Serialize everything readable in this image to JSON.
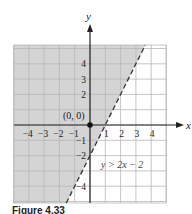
{
  "chart_data": {
    "type": "line",
    "title": "",
    "xlabel": "x",
    "ylabel": "y",
    "xlim": [
      -5,
      5
    ],
    "ylim": [
      -5,
      5
    ],
    "grid": true,
    "x_tick_labels": [
      "-4",
      "-3",
      "-2",
      "-1",
      "1",
      "2",
      "3",
      "4"
    ],
    "y_tick_labels": [
      "4",
      "3",
      "2",
      "-1",
      "-2",
      "-4"
    ],
    "series": [
      {
        "name": "y = 2x - 2",
        "style": "dashed",
        "slope": 2,
        "intercept": -2,
        "points": [
          {
            "x": -1.5,
            "y": -5
          },
          {
            "x": 3.5,
            "y": 5
          }
        ]
      }
    ],
    "shaded_region": "y > 2x - 2 (left/above the boundary line)",
    "test_point": {
      "x": 0,
      "y": 0,
      "label": "(0, 0)"
    },
    "annotations": [
      {
        "text": "y > 2x − 2",
        "x": 1,
        "y": -2.2
      },
      {
        "text": "(0, 0)",
        "x": -1.5,
        "y": 0.5
      }
    ]
  },
  "labels": {
    "x_axis": "x",
    "y_axis": "y",
    "point": "(0, 0)",
    "inequality": "y > 2x − 2",
    "caption": "Figure 4.33"
  },
  "colors": {
    "shade": "#d4d4d4",
    "grid": "#b8b8b8",
    "axis": "#222222"
  }
}
